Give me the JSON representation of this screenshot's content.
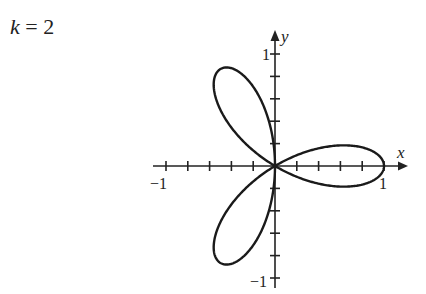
{
  "title": {
    "var": "k",
    "eq": " = 2"
  },
  "chart_data": {
    "type": "line",
    "title": "k = 2",
    "curve": "polar rose r = cos(3θ), three petals",
    "xlabel": "x",
    "ylabel": "y",
    "xlim": [
      -1,
      1
    ],
    "ylim": [
      -1,
      1
    ],
    "x_tick_labels": [
      "-1",
      "1"
    ],
    "y_tick_labels": [
      "1",
      "-1"
    ],
    "tick_step": 0.2,
    "petal_angles_deg": [
      0,
      120,
      240
    ],
    "grid": false
  },
  "axis": {
    "x_label": "x",
    "y_label": "y",
    "x_min_label": "−1",
    "x_max_label": "1",
    "y_max_label": "1",
    "y_min_label": "−1"
  }
}
